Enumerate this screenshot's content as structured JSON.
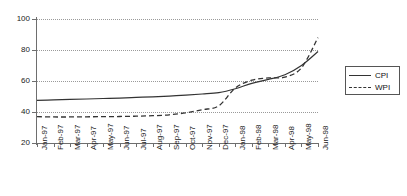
{
  "chart_data": {
    "type": "line",
    "title": "",
    "xlabel": "",
    "ylabel": "",
    "ylim": [
      20,
      100
    ],
    "yticks": [
      20,
      40,
      60,
      80,
      100
    ],
    "grid": true,
    "legend_position": "right",
    "categories": [
      "Jan-97",
      "Feb-97",
      "Mar-97",
      "Apr-97",
      "May-97",
      "Jun-97",
      "Jul-97",
      "Aug-97",
      "Sep-97",
      "Oct-97",
      "Nov-97",
      "Dec-97",
      "Jan-98",
      "Feb-98",
      "Mar-98",
      "Apr-98",
      "May-98",
      "Jun-98"
    ],
    "series": [
      {
        "name": "CPI",
        "style": "solid",
        "color": "#333333",
        "values": [
          47.5,
          47.8,
          48.1,
          48.4,
          48.7,
          49.0,
          49.4,
          49.8,
          50.3,
          50.9,
          51.6,
          52.5,
          55.0,
          58.5,
          61.0,
          64.0,
          70.0,
          79.0
        ]
      },
      {
        "name": "WPI",
        "style": "dashed",
        "color": "#333333",
        "values": [
          37.0,
          36.8,
          36.8,
          36.9,
          37.0,
          37.1,
          37.3,
          37.6,
          38.2,
          39.5,
          41.5,
          44.0,
          55.5,
          60.5,
          62.0,
          62.5,
          68.5,
          88.0
        ]
      }
    ]
  },
  "legend": {
    "entries": [
      {
        "label": "CPI",
        "style": "solid"
      },
      {
        "label": "WPI",
        "style": "dashed"
      }
    ]
  },
  "axes": {
    "y_tick_labels": [
      "100",
      "80",
      "60",
      "40",
      "20"
    ],
    "x_tick_labels": [
      "Jan-97",
      "Feb-97",
      "Mar-97",
      "Apr-97",
      "May-97",
      "Jun-97",
      "Jul-97",
      "Aug-97",
      "Sep-97",
      "Oct-97",
      "Nov-97",
      "Dec-97",
      "Jan-98",
      "Feb-98",
      "Mar-98",
      "Apr-98",
      "May-98",
      "Jun-98"
    ]
  }
}
